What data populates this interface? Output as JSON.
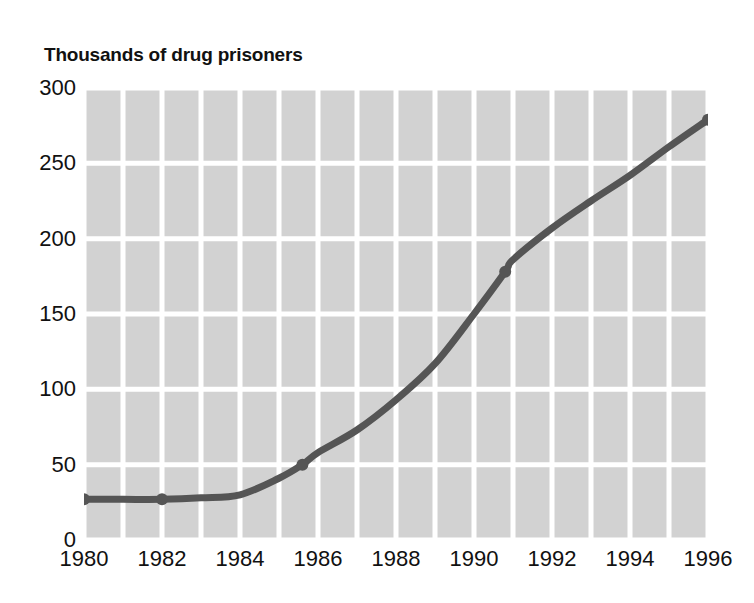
{
  "chart_data": {
    "type": "line",
    "title": "Thousands of drug prisoners",
    "xlabel": "",
    "ylabel": "",
    "xlim": [
      1980,
      1996
    ],
    "ylim": [
      0,
      300
    ],
    "yticks": [
      0,
      50,
      100,
      150,
      200,
      250,
      300
    ],
    "ytick_labels": [
      "0",
      "50",
      "100",
      "150",
      "200",
      "250",
      "300"
    ],
    "xticks": [
      1980,
      1982,
      1984,
      1986,
      1988,
      1990,
      1992,
      1994,
      1996
    ],
    "xtick_labels": [
      "1980",
      "1982",
      "1984",
      "1986",
      "1988",
      "1990",
      "1992",
      "1994",
      "1996"
    ],
    "grid": true,
    "grid_color": "#ffffff",
    "grid_x_step": 1,
    "grid_y_step": 50,
    "plot_background": "#d2d2d2",
    "legend": null,
    "series": [
      {
        "name": "Drug prisoners",
        "color": "#555555",
        "line_width": 7,
        "x": [
          1980,
          1981,
          1982,
          1983,
          1984,
          1985,
          1985.6,
          1986,
          1987,
          1988,
          1989,
          1990,
          1990.8,
          1991,
          1992,
          1993,
          1994,
          1995,
          1996
        ],
        "values": [
          27,
          27,
          27,
          28,
          30,
          41,
          50,
          58,
          73,
          93,
          117,
          150,
          178,
          186,
          207,
          225,
          242,
          261,
          279
        ],
        "markers": [
          {
            "x": 1980,
            "y": 27
          },
          {
            "x": 1982,
            "y": 27
          },
          {
            "x": 1985.6,
            "y": 50
          },
          {
            "x": 1990.8,
            "y": 178
          },
          {
            "x": 1996,
            "y": 279
          }
        ]
      }
    ]
  }
}
